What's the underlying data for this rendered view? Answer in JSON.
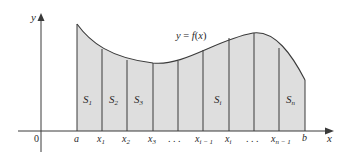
{
  "figure": {
    "curve_label": "y = f(x)",
    "axes": {
      "x_label": "x",
      "y_label": "y",
      "origin_label": "0"
    },
    "tick_labels": [
      "a",
      "x1",
      "x2",
      "x3",
      "...",
      "x(i-1)",
      "xi",
      "...",
      "x(n-1)",
      "b"
    ],
    "strip_labels": [
      "S1",
      "S2",
      "S3",
      "Si",
      "Sn"
    ],
    "colors": {
      "fill": "#dedede",
      "stroke": "#3a3a3a",
      "axis": "#3a3a3a",
      "text": "#2a2a2a"
    }
  }
}
